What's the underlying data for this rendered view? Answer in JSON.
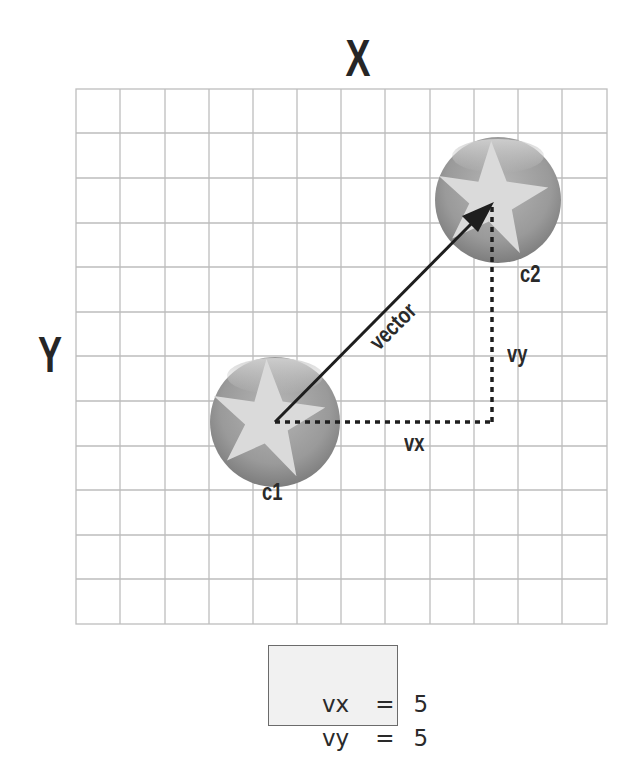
{
  "diagram": {
    "axes": {
      "x_label": "X",
      "y_label": "Y"
    },
    "grid": {
      "columns": 12,
      "rows": 12,
      "line_color": "#bdbdbd"
    },
    "points": [
      {
        "id": "c1",
        "label": "c1",
        "grid_x": 4.5,
        "grid_y": 7.5
      },
      {
        "id": "c2",
        "label": "c2",
        "grid_x": 9.5,
        "grid_y": 2.5
      }
    ],
    "vector": {
      "label": "vector",
      "from": "c1",
      "to": "c2"
    },
    "components": {
      "vx_label": "vx",
      "vy_label": "vy"
    },
    "values": [
      {
        "name": "vx",
        "eq": "=",
        "value": "5"
      },
      {
        "name": "vy",
        "eq": "=",
        "value": "5"
      }
    ],
    "colors": {
      "ball_dark": "#7f7f7f",
      "ball_light": "#b8b8b8",
      "star": "#dcdcdc",
      "arrow": "#222222"
    }
  }
}
